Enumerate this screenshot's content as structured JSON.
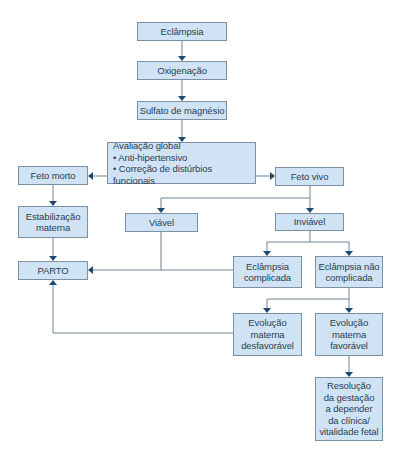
{
  "diagram": {
    "nodes": {
      "eclampsia": "Eclâmpsia",
      "oxigenacao": "Oxigenação",
      "sulfato": "Sulfato de magnésio",
      "avaliacao": {
        "title": "Avaliação global",
        "items": [
          "• Anti-hipertensivo",
          "• Correção de distúrbios funcionais"
        ]
      },
      "feto_morto": "Feto morto",
      "feto_vivo": "Feto vivo",
      "estabilizacao": [
        "Estabilização",
        "materna"
      ],
      "viavel": "Viável",
      "inviavel": "Inviável",
      "parto": "PARTO",
      "eclampsia_complicada": [
        "Eclâmpsia",
        "complicada"
      ],
      "eclampsia_nao_complicada": [
        "Eclâmpsia não",
        "complicada"
      ],
      "evolucao_desfavoravel": [
        "Evolução",
        "materna",
        "desfavorável"
      ],
      "evolucao_favoravel": [
        "Evolução",
        "materna",
        "favorável"
      ],
      "resolucao": [
        "Resolução",
        "da gestação",
        "a depender",
        "da clínica/",
        "vitalidade fetal"
      ]
    },
    "colors": {
      "box_fill": "#cfe3f4",
      "box_border": "#7b90a3",
      "line": "#6f8294",
      "arrow": "#1f4a6e",
      "text": "#2a3f52"
    }
  }
}
